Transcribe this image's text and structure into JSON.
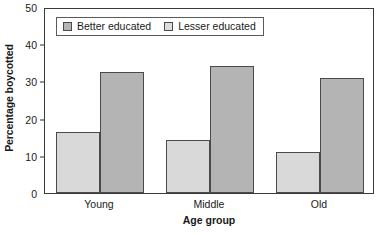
{
  "chart_data": {
    "type": "bar",
    "title": "",
    "subtitle": "",
    "xlabel": "Age group",
    "ylabel": "Percentage boycotted",
    "categories": [
      "Young",
      "Middle",
      "Old"
    ],
    "series": [
      {
        "name": "Better educated",
        "values": [
          16.3,
          14.2,
          11.0
        ],
        "color": "#d9d9d9"
      },
      {
        "name": "Lesser educated",
        "values": [
          32.5,
          34.2,
          31.0
        ],
        "color": "#b4b4b4"
      }
    ],
    "ylim": [
      0,
      50
    ],
    "yticks": [
      0,
      10,
      20,
      30,
      40,
      50
    ],
    "ytick_labels": [
      "0",
      "10",
      "20",
      "30",
      "40",
      "50"
    ],
    "grid": false,
    "legend_position": "upper-left-inside",
    "frame": true
  }
}
